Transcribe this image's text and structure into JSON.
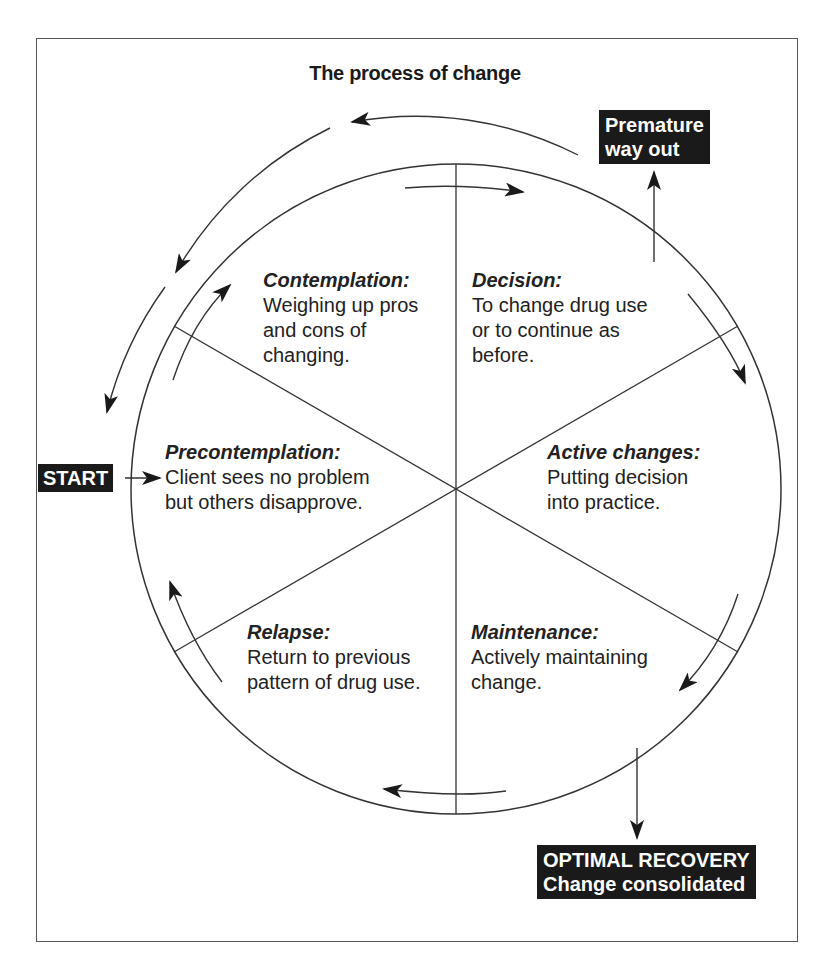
{
  "title": "The process of change",
  "colors": {
    "ink": "#1a1a1a",
    "label_bg": "#1a1a1a",
    "label_text": "#ffffff",
    "frame": "#555555",
    "background": "#ffffff"
  },
  "stages": [
    {
      "name": "Contemplation:",
      "description": "Weighing up pros\nand cons of\nchanging."
    },
    {
      "name": "Decision:",
      "description": "To change drug use\nor to continue as\nbefore."
    },
    {
      "name": "Precontemplation:",
      "description": "Client sees no problem\nbut others disapprove."
    },
    {
      "name": "Active changes:",
      "description": "Putting decision\ninto practice."
    },
    {
      "name": "Relapse:",
      "description": "Return to previous\npattern of drug use."
    },
    {
      "name": "Maintenance:",
      "description": "Actively maintaining\nchange."
    }
  ],
  "labels": {
    "start": "START",
    "premature": "Premature\nway out",
    "recovery": "OPTIMAL RECOVERY\nChange consolidated"
  },
  "icons": {
    "flow_arrow": "arrowhead-icon"
  }
}
